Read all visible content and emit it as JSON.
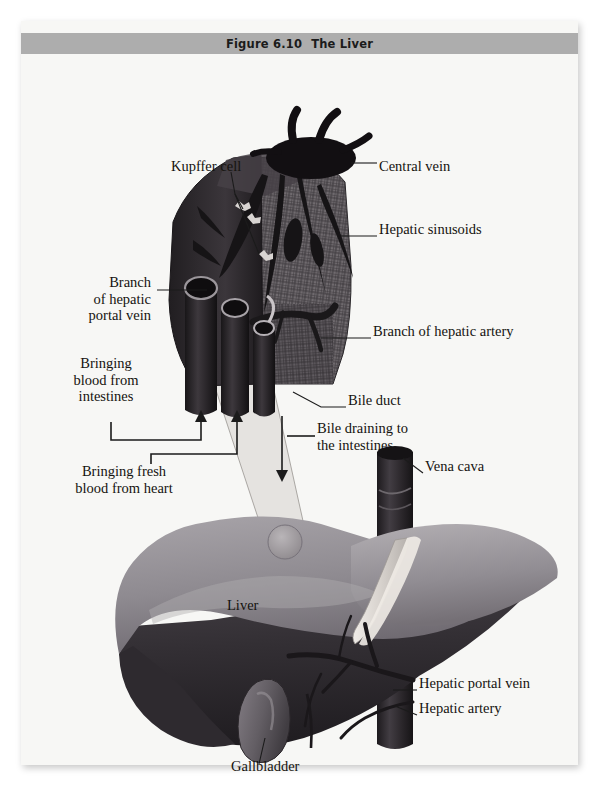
{
  "figure": {
    "number": "Figure 6.10",
    "title": "The Liver",
    "domain": "anatomy-illustration"
  },
  "colors": {
    "page_background": "#f7f7f5",
    "title_bar": "#adadad",
    "title_text": "#1b1b1b",
    "label_text": "#15130f",
    "leader_line": "#1b1b1b",
    "liver_top": "#8e8a90",
    "liver_top_light": "#a5a1a6",
    "liver_underside": "#3a353a",
    "liver_dark_edge": "#272327",
    "vena_cava": "#2b272b",
    "gallbladder": "#6c666c",
    "lobule_mesh": "#6f6a6e",
    "lobule_dark": "#2a272a",
    "central_vein_cap": "#120f12",
    "ligament": "#dcd8d4",
    "cone_fill": "#e2e0dd"
  },
  "labels": [
    {
      "id": "kupffer-cell",
      "text": "Kupffer cell",
      "lines": [
        "Kupffer cell"
      ],
      "align": "left",
      "x": 150,
      "y": 113
    },
    {
      "id": "central-vein",
      "text": "Central vein",
      "lines": [
        "Central vein"
      ],
      "align": "left",
      "x": 358,
      "y": 113
    },
    {
      "id": "hepatic-sinusoids",
      "text": "Hepatic sinusoids",
      "lines": [
        "Hepatic sinusoids"
      ],
      "align": "left",
      "x": 358,
      "y": 176
    },
    {
      "id": "branch-hepatic-portal-vein",
      "text": "Branch of hepatic portal vein",
      "lines": [
        "Branch",
        "of hepatic",
        "portal vein"
      ],
      "align": "right",
      "x": 62,
      "y": 229
    },
    {
      "id": "branch-hepatic-artery",
      "text": "Branch of hepatic artery",
      "lines": [
        "Branch of hepatic artery"
      ],
      "align": "left",
      "x": 352,
      "y": 278
    },
    {
      "id": "bringing-blood-intestines",
      "text": "Bringing blood from intestines",
      "lines": [
        "Bringing",
        "blood from",
        "intestines"
      ],
      "align": "center",
      "x": 68,
      "y": 310
    },
    {
      "id": "bile-duct",
      "text": "Bile duct",
      "lines": [
        "Bile duct"
      ],
      "align": "left",
      "x": 327,
      "y": 347
    },
    {
      "id": "bile-draining-intestines",
      "text": "Bile draining to the intestines",
      "lines": [
        "Bile draining to",
        "the intestines"
      ],
      "align": "left",
      "x": 268,
      "y": 375
    },
    {
      "id": "bringing-fresh-blood-heart",
      "text": "Bringing fresh blood from heart",
      "lines": [
        "Bringing fresh",
        "blood from heart"
      ],
      "align": "center",
      "x": 62,
      "y": 418
    },
    {
      "id": "vena-cava",
      "text": "Vena cava",
      "lines": [
        "Vena cava"
      ],
      "align": "left",
      "x": 404,
      "y": 413
    },
    {
      "id": "liver",
      "text": "Liver",
      "lines": [
        "Liver"
      ],
      "align": "left",
      "x": 206,
      "y": 552
    },
    {
      "id": "hepatic-portal-vein",
      "text": "Hepatic portal vein",
      "lines": [
        "Hepatic portal vein"
      ],
      "align": "left",
      "x": 398,
      "y": 630
    },
    {
      "id": "hepatic-artery",
      "text": "Hepatic artery",
      "lines": [
        "Hepatic artery"
      ],
      "align": "left",
      "x": 398,
      "y": 655
    },
    {
      "id": "gallbladder",
      "text": "Gallbladder",
      "lines": [
        "Gallbladder"
      ],
      "align": "left",
      "x": 210,
      "y": 713
    }
  ],
  "flow_arrows": [
    {
      "id": "blood-from-intestines-arrow",
      "direction": "up",
      "meaning": "blood from intestines enters lobule"
    },
    {
      "id": "fresh-blood-from-heart-arrow",
      "direction": "up",
      "meaning": "fresh blood from heart enters lobule"
    },
    {
      "id": "bile-draining-arrow",
      "direction": "down",
      "meaning": "bile drains to the intestines"
    }
  ]
}
